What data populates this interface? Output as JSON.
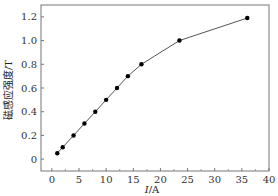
{
  "chart_data": {
    "type": "line",
    "title": "",
    "xlabel": "I/A",
    "ylabel": "磁感应强度/T",
    "xlim": [
      -2,
      40
    ],
    "ylim": [
      -0.1,
      1.3
    ],
    "xticks": [
      0,
      5,
      10,
      15,
      20,
      25,
      30,
      35,
      40
    ],
    "yticks": [
      0,
      0.2,
      0.4,
      0.6,
      0.8,
      1.0,
      1.2
    ],
    "xtick_labels": [
      "0",
      "5",
      "10",
      "15",
      "20",
      "25",
      "30",
      "35",
      "40"
    ],
    "ytick_labels": [
      "0",
      "0.2",
      "0.4",
      "0.6",
      "0.8",
      "1.0",
      "1.2"
    ],
    "grid": false,
    "legend": null,
    "series": [
      {
        "name": "B-I",
        "marker": "circle",
        "color": "#000000",
        "line_color": "#555555",
        "x": [
          1,
          2,
          4,
          6,
          8,
          10,
          12,
          14,
          16.5,
          23.5,
          36
        ],
        "y": [
          0.05,
          0.1,
          0.2,
          0.3,
          0.4,
          0.5,
          0.6,
          0.7,
          0.8,
          1.0,
          1.19
        ]
      }
    ]
  }
}
